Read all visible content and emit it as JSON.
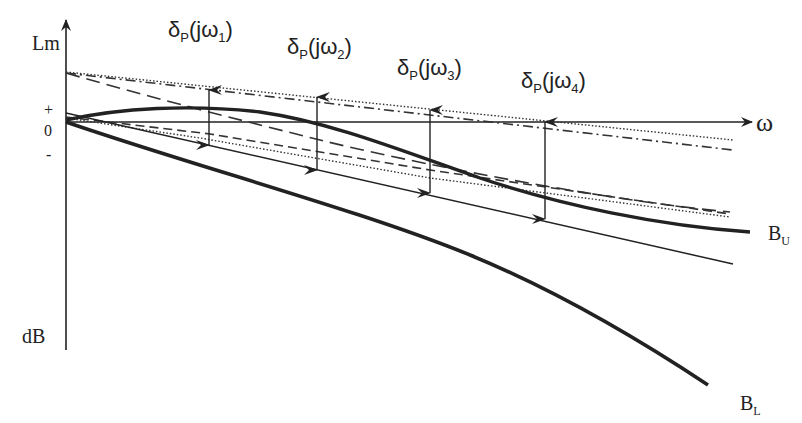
{
  "axes": {
    "y_label_top": "Lm",
    "y_label_bottom": "dB",
    "x_label": "ω",
    "tick_plus": "+",
    "tick_zero": "0",
    "tick_minus": "-"
  },
  "uncertainty_labels": [
    {
      "main": "δ",
      "sub": "P",
      "paren_open": "(jω",
      "index": "1",
      "paren_close": ")"
    },
    {
      "main": "δ",
      "sub": "P",
      "paren_open": "(jω",
      "index": "2",
      "paren_close": ")"
    },
    {
      "main": "δ",
      "sub": "P",
      "paren_open": "(jω",
      "index": "3",
      "paren_close": ")"
    },
    {
      "main": "δ",
      "sub": "P",
      "paren_open": "(jω",
      "index": "4",
      "paren_close": ")"
    }
  ],
  "bounds": {
    "upper": {
      "main": "B",
      "sub": "U"
    },
    "lower": {
      "main": "B",
      "sub": "L"
    }
  },
  "colors": {
    "ink": "#222222",
    "background": "#ffffff"
  }
}
